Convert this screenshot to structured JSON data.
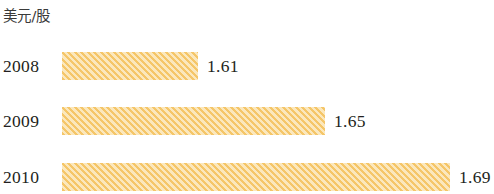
{
  "chart_data": {
    "type": "bar",
    "orientation": "horizontal",
    "title": "",
    "unit_label": "美元/股",
    "xlabel": "",
    "ylabel": "",
    "grid": false,
    "legend": null,
    "categories": [
      "2008",
      "2009",
      "2010"
    ],
    "values": [
      1.61,
      1.65,
      1.69
    ],
    "value_labels": [
      "1.61",
      "1.65",
      "1.69"
    ],
    "series": [
      {
        "name": "美元/股",
        "values": [
          1.61,
          1.65,
          1.69
        ]
      }
    ],
    "bar_color": "#f5c669",
    "bar_hatch": "diagonal-stripes",
    "axis_start": 1.57,
    "bars": [
      {
        "category": "2008",
        "value": 1.61,
        "value_label": "1.61",
        "bar_px": 136,
        "label_px": 207
      },
      {
        "category": "2009",
        "value": 1.65,
        "value_label": "1.65",
        "bar_px": 263,
        "label_px": 334
      },
      {
        "category": "2010",
        "value": 1.69,
        "value_label": "1.69",
        "bar_px": 388,
        "label_px": 459
      }
    ]
  }
}
